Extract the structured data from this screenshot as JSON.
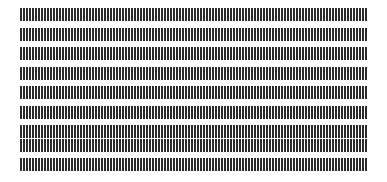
{
  "image": {
    "title": "Vertical tick mark pattern",
    "description": "Nine horizontal rows of closely spaced vertical tick marks on a white background",
    "width": 387,
    "height": 182,
    "background_color": "#ffffff"
  },
  "pattern": {
    "type": "tick-rows",
    "row_count": 9,
    "ticks_per_row": 116,
    "tick_color": "#2b2b2b",
    "tick_width_px": 1.5,
    "tick_pitch_px": 3,
    "tick_height_px": 13,
    "row_pitch_px": 19.5,
    "first_row_top_px": 8,
    "left_margin_px": 20,
    "right_edge_px": 367
  },
  "chart_data": {
    "type": "bar",
    "subtitle": "",
    "xlabel": "",
    "ylabel": "",
    "grid": false,
    "legend": null,
    "categories": [],
    "rows": [
      {
        "index": 1,
        "label": "row-1",
        "top_px": 8,
        "tick_count": 116,
        "tick_height_px": 13
      },
      {
        "index": 2,
        "label": "row-2",
        "top_px": 27.5,
        "tick_count": 116,
        "tick_height_px": 13
      },
      {
        "index": 3,
        "label": "row-3",
        "top_px": 47,
        "tick_count": 116,
        "tick_height_px": 13
      },
      {
        "index": 4,
        "label": "row-4",
        "top_px": 66.5,
        "tick_count": 116,
        "tick_height_px": 13
      },
      {
        "index": 5,
        "label": "row-5",
        "top_px": 86,
        "tick_count": 116,
        "tick_height_px": 13
      },
      {
        "index": 6,
        "label": "row-6",
        "top_px": 105.5,
        "tick_count": 116,
        "tick_height_px": 13
      },
      {
        "index": 7,
        "label": "row-7",
        "top_px": 125,
        "tick_count": 116,
        "tick_height_px": 13
      },
      {
        "index": 8,
        "label": "row-8",
        "top_px": 139,
        "tick_count": 116,
        "tick_height_px": 13
      },
      {
        "index": 9,
        "label": "row-9",
        "top_px": 158,
        "tick_count": 116,
        "tick_height_px": 13
      }
    ]
  }
}
